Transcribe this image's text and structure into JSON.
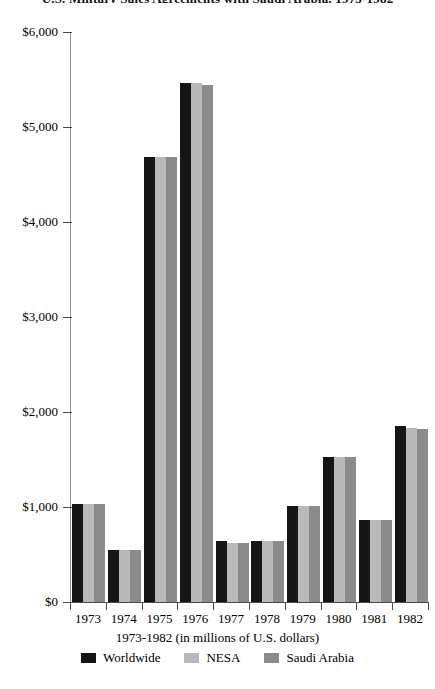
{
  "chart_data": {
    "type": "bar",
    "title": "U.S. Military Sales Agreements with Saudi Arabia, 1973-1982",
    "subtitle": "",
    "xlabel": "1973-1982 (in millions of U.S. dollars)",
    "ylabel": "",
    "categories": [
      "1973",
      "1974",
      "1975",
      "1976",
      "1977",
      "1978",
      "1979",
      "1980",
      "1981",
      "1982"
    ],
    "series": [
      {
        "name": "Worldwide",
        "color": "#151515",
        "values": [
          1030,
          550,
          4680,
          5460,
          640,
          640,
          1010,
          1530,
          860,
          1850
        ]
      },
      {
        "name": "NESA",
        "color": "#b9b9b9",
        "values": [
          1030,
          550,
          4680,
          5460,
          620,
          640,
          1010,
          1530,
          860,
          1830
        ]
      },
      {
        "name": "Saudi Arabia",
        "color": "#8b8b8b",
        "values": [
          1030,
          550,
          4680,
          5440,
          620,
          640,
          1010,
          1530,
          860,
          1820
        ]
      }
    ],
    "ylim": [
      0,
      6000
    ],
    "y_ticks": [
      0,
      1000,
      2000,
      3000,
      4000,
      5000,
      6000
    ],
    "y_tick_labels": [
      "$0",
      "$1,000",
      "$2,000",
      "$3,000",
      "$4,000",
      "$5,000",
      "$6,000"
    ],
    "grid": false,
    "legend_position": "bottom"
  },
  "legend": {
    "entries": [
      {
        "label": "Worldwide",
        "swatch": "worldwide"
      },
      {
        "label": "NESA",
        "swatch": "nesa"
      },
      {
        "label": "Saudi Arabia",
        "swatch": "saudi"
      }
    ]
  }
}
